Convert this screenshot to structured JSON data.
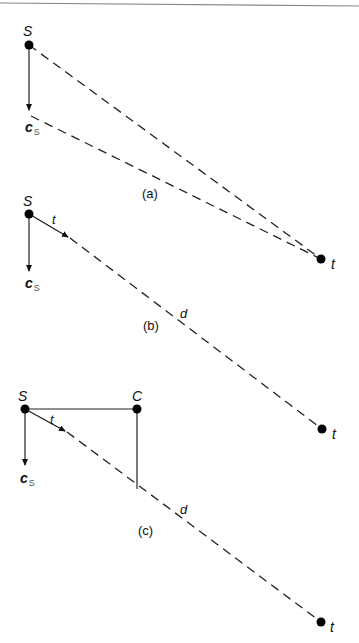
{
  "figure": {
    "top_rule": true,
    "panels": [
      {
        "caption": "(a)",
        "nodes": [
          {
            "id": "S",
            "label": "S",
            "x": 29,
            "y": 45
          },
          {
            "id": "t",
            "label": "t",
            "x": 321,
            "y": 259
          }
        ],
        "vectors": [
          {
            "label": "c",
            "subscript": "S",
            "from": [
              29,
              45
            ],
            "to": [
              29,
              112
            ],
            "style": "solid-arrow"
          }
        ],
        "edges": [
          {
            "from": "S",
            "to": "t",
            "style": "dashed"
          },
          {
            "from": "c_S tip",
            "to": "t",
            "style": "dashed"
          }
        ]
      },
      {
        "caption": "(b)",
        "nodes": [
          {
            "id": "S",
            "label": "S",
            "x": 29,
            "y": 214
          },
          {
            "id": "t",
            "label": "t",
            "x": 322,
            "y": 429
          }
        ],
        "vectors": [
          {
            "label": "c",
            "subscript": "S",
            "from": [
              29,
              214
            ],
            "to": [
              29,
              273
            ],
            "style": "solid-arrow"
          },
          {
            "label": "t",
            "from": [
              29,
              214
            ],
            "to": [
              70,
              238
            ],
            "style": "solid-arrow"
          }
        ],
        "edges": [
          {
            "from": "S",
            "to": "t",
            "label": "d",
            "style": "dashed"
          }
        ]
      },
      {
        "caption": "(c)",
        "nodes": [
          {
            "id": "S",
            "label": "S",
            "x": 25,
            "y": 409
          },
          {
            "id": "C",
            "label": "C",
            "x": 137,
            "y": 409
          },
          {
            "id": "t",
            "label": "t",
            "x": 321,
            "y": 622
          }
        ],
        "vectors": [
          {
            "label": "c",
            "subscript": "S",
            "from": [
              25,
              409
            ],
            "to": [
              25,
              467
            ],
            "style": "solid-arrow"
          },
          {
            "label": "t",
            "from": [
              25,
              409
            ],
            "to": [
              67,
              432
            ],
            "style": "solid-arrow"
          }
        ],
        "edges": [
          {
            "from": "S",
            "to": "C",
            "style": "solid"
          },
          {
            "from": "C",
            "to": "projection on d",
            "style": "solid"
          },
          {
            "from": "S",
            "to": "t",
            "label": "d",
            "style": "dashed"
          }
        ]
      }
    ]
  },
  "labels": {
    "a": {
      "S": "S",
      "cs_main": "c",
      "cs_sub": "S",
      "t": "t",
      "caption": "(a)"
    },
    "b": {
      "S": "S",
      "cs_main": "c",
      "cs_sub": "S",
      "t_vec": "t",
      "d": "d",
      "t": "t",
      "caption": "(b)"
    },
    "c": {
      "S": "S",
      "C": "C",
      "cs_main": "c",
      "cs_sub": "S",
      "t_vec": "t",
      "d": "d",
      "t": "t",
      "caption": "(c)"
    }
  }
}
